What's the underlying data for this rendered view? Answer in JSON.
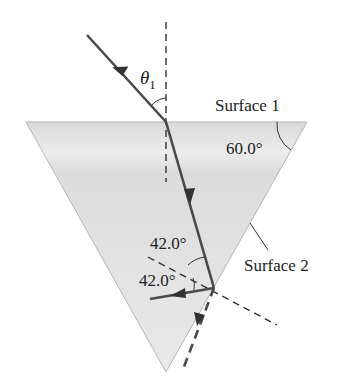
{
  "diagram": {
    "type": "prism-refraction",
    "labels": {
      "theta1": "θ",
      "theta1_sub": "1",
      "surface1": "Surface 1",
      "surface2": "Surface 2",
      "apex_angle": "60.0°",
      "angle_incident_s2": "42.0°",
      "angle_reflected_s2": "42.0°"
    },
    "colors": {
      "prism_fill": "#e6e6e6",
      "prism_edge": "#b0b0b0",
      "ray": "#4a4a4a",
      "normal": "#333333",
      "text": "#222222"
    },
    "geometry": {
      "prism_vertices": [
        [
          26,
          122
        ],
        [
          307,
          122
        ],
        [
          166,
          372
        ]
      ],
      "incident_ray": [
        [
          87,
          35
        ],
        [
          166,
          122
        ]
      ],
      "refracted_ray": [
        [
          166,
          122
        ],
        [
          214,
          288
        ]
      ],
      "reflected_ray": [
        [
          214,
          288
        ],
        [
          150,
          300
        ]
      ],
      "exit_dashed_ray": [
        [
          214,
          288
        ],
        [
          180,
          372
        ]
      ],
      "normal_surface1": [
        [
          166,
          20
        ],
        [
          166,
          180
        ]
      ],
      "normal_surface2": [
        [
          148,
          245
        ],
        [
          277,
          325
        ]
      ]
    }
  }
}
